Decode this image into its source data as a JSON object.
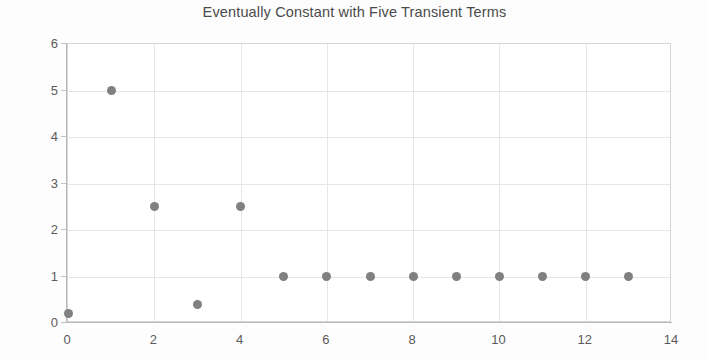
{
  "chart_data": {
    "type": "scatter",
    "title": "Eventually Constant with Five Transient Terms",
    "xlabel": "",
    "ylabel": "",
    "xlim": [
      0,
      14
    ],
    "ylim": [
      0,
      6
    ],
    "grid": true,
    "legend": null,
    "marker_color": "#808080",
    "marker_shape": "circle",
    "x": [
      0,
      1,
      2,
      3,
      4,
      5,
      6,
      7,
      8,
      9,
      10,
      11,
      12,
      13
    ],
    "values": [
      0.2,
      5,
      2.5,
      0.4,
      2.5,
      1,
      1,
      1,
      1,
      1,
      1,
      1,
      1,
      1
    ],
    "series": [
      {
        "name": "sequence",
        "x": [
          0,
          1,
          2,
          3,
          4,
          5,
          6,
          7,
          8,
          9,
          10,
          11,
          12,
          13
        ],
        "values": [
          0.2,
          5,
          2.5,
          0.4,
          2.5,
          1,
          1,
          1,
          1,
          1,
          1,
          1,
          1,
          1
        ]
      }
    ],
    "xticks": [
      0,
      2,
      4,
      6,
      8,
      10,
      12,
      14
    ],
    "xticklabels": [
      "0",
      "2",
      "4",
      "6",
      "8",
      "10",
      "12",
      "14"
    ],
    "yticks": [
      0,
      1,
      2,
      3,
      4,
      5,
      6
    ],
    "yticklabels": [
      "0",
      "1",
      "2",
      "3",
      "4",
      "5",
      "6"
    ],
    "gridline_color": "#e6e6e6",
    "axis_color": "#b9b9b9",
    "title_color": "#4a4a4a",
    "background_color": "#ffffff"
  }
}
